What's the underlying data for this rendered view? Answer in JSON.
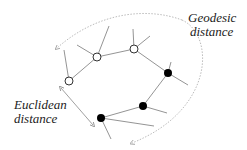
{
  "labels": {
    "geodesic": [
      "Geodesic",
      "distance"
    ],
    "euclidean": [
      "Euclidean",
      "distance"
    ]
  },
  "colors": {
    "line": "#888888",
    "node_stroke": "#333333",
    "filled": "#000000",
    "open": "#ffffff",
    "text": "#222222",
    "arrow": "#999999"
  },
  "nodes": [
    {
      "id": "n1",
      "x": 69,
      "y": 81,
      "type": "open"
    },
    {
      "id": "n2",
      "x": 97,
      "y": 57,
      "type": "open"
    },
    {
      "id": "n3",
      "x": 134,
      "y": 49,
      "type": "open"
    },
    {
      "id": "n4",
      "x": 168,
      "y": 73,
      "type": "filled"
    },
    {
      "id": "n5",
      "x": 143,
      "y": 106,
      "type": "filled"
    },
    {
      "id": "n6",
      "x": 101,
      "y": 118,
      "type": "filled"
    }
  ]
}
